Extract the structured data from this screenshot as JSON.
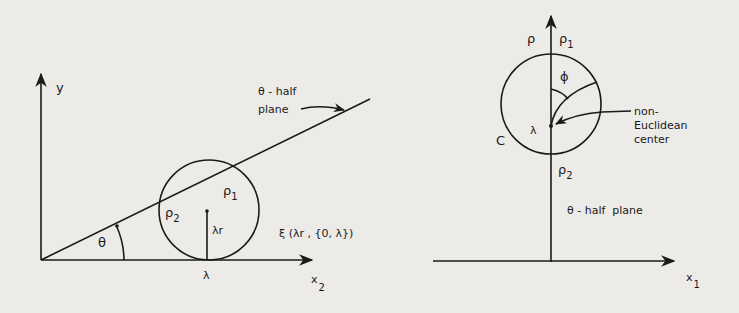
{
  "figure": {
    "background": "#ecebe7",
    "ink": "#1a1a1a",
    "left_diagram": {
      "y_axis_label": "y",
      "x_axis_label": "x",
      "x_axis_subscript": "2",
      "half_plane_label_line1": "θ - half",
      "half_plane_label_line2": "plane",
      "angle_label": "θ",
      "rho1_label": "ρ",
      "rho1_sub": "1",
      "rho2_label": "ρ",
      "rho2_sub": "2",
      "radius_label": "λr",
      "tangent_point_label": "λ",
      "circle_label": "ξ (λr , {0, λ})"
    },
    "right_diagram": {
      "vertical_axis_label": "ρ",
      "rho1_label": "ρ",
      "rho1_sub": "1",
      "rho2_label": "ρ",
      "rho2_sub": "2",
      "phi_label": "ϕ",
      "circle_label": "C",
      "center_point_label": "λ",
      "callout_line1": "non-",
      "callout_line2": "Euclidean",
      "callout_line3": "center",
      "half_plane_label": "θ - half  plane",
      "x_axis_label": "x",
      "x_axis_subscript": "1"
    }
  }
}
